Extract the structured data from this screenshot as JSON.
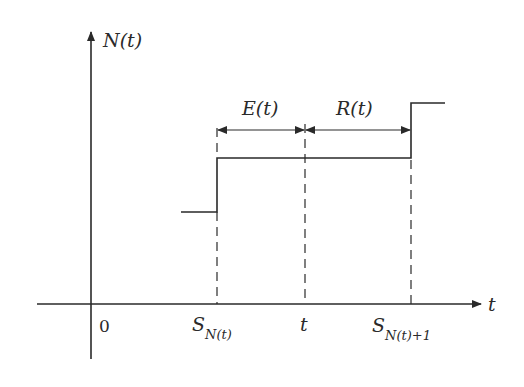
{
  "diagram": {
    "y_axis_label": "N(t)",
    "x_axis_label": "t",
    "origin_label": "0",
    "x_ticks": [
      {
        "id": "s_nt",
        "base": "S",
        "sub": "N(t)"
      },
      {
        "id": "t",
        "base": "t",
        "sub": ""
      },
      {
        "id": "s_nt1",
        "base": "S",
        "sub": "N(t)+1"
      }
    ],
    "intervals": [
      {
        "label": "E(t)",
        "from": "S_N(t)",
        "to": "t"
      },
      {
        "label": "R(t)",
        "from": "t",
        "to": "S_N(t)+1"
      }
    ],
    "step_levels": [
      "N(t)-1",
      "N(t)",
      "N(t)+1"
    ],
    "colors": {
      "line": "#2a2a2a",
      "background": "#ffffff"
    }
  }
}
